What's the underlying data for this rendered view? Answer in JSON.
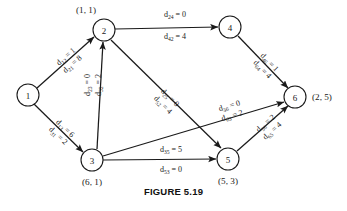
{
  "figure": {
    "caption": "FIGURE 5.19",
    "type": "directed-graph-diagram"
  },
  "nodes": [
    {
      "id": "1",
      "label_pair": "",
      "cx": 28,
      "cy": 95,
      "r": 11
    },
    {
      "id": "2",
      "label_pair": "(1, 1)",
      "cx": 104,
      "cy": 30,
      "r": 11
    },
    {
      "id": "3",
      "label_pair": "(6, 1)",
      "cx": 92,
      "cy": 160,
      "r": 11
    },
    {
      "id": "4",
      "label_pair": "",
      "cx": 230,
      "cy": 27,
      "r": 11
    },
    {
      "id": "5",
      "label_pair": "(5, 3)",
      "cx": 228,
      "cy": 159,
      "r": 11
    },
    {
      "id": "6",
      "label_pair": "(2, 5)",
      "cx": 295,
      "cy": 97,
      "r": 11
    }
  ],
  "edges": [
    {
      "name": "edge-1-2",
      "from": "1",
      "to": "2",
      "forward_label": "d12 = 1",
      "reverse_label": "d21 = 8",
      "forward": {
        "sub": "12",
        "value": "1"
      },
      "reverse": {
        "sub": "21",
        "value": "8"
      }
    },
    {
      "name": "edge-1-3",
      "from": "1",
      "to": "3",
      "forward_label": "d13 = 6",
      "reverse_label": "d31 = 2",
      "forward": {
        "sub": "13",
        "value": "6"
      },
      "reverse": {
        "sub": "31",
        "value": "2"
      }
    },
    {
      "name": "edge-2-3",
      "from": "3",
      "to": "2",
      "forward_label": "d23 = 0",
      "reverse_label": "d32 = 2",
      "forward": {
        "sub": "23",
        "value": "0"
      },
      "reverse": {
        "sub": "32",
        "value": "2"
      }
    },
    {
      "name": "edge-2-4",
      "from": "2",
      "to": "4",
      "forward_label": "d24 = 0",
      "reverse_label": "d42 = 4",
      "forward": {
        "sub": "24",
        "value": "0"
      },
      "reverse": {
        "sub": "42",
        "value": "4"
      }
    },
    {
      "name": "edge-2-5",
      "from": "2",
      "to": "5",
      "forward_label": "d25 = 0",
      "reverse_label": "d52 = 4",
      "forward": {
        "sub": "25",
        "value": "0"
      },
      "reverse": {
        "sub": "52",
        "value": "4"
      }
    },
    {
      "name": "edge-4-6",
      "from": "4",
      "to": "6",
      "forward_label": "d46 = 1",
      "reverse_label": "d64 = 4",
      "forward": {
        "sub": "46",
        "value": "1"
      },
      "reverse": {
        "sub": "64",
        "value": "4"
      }
    },
    {
      "name": "edge-3-6",
      "from": "3",
      "to": "6",
      "forward_label": "d36 = 0",
      "reverse_label": "d63 = 2",
      "forward": {
        "sub": "36",
        "value": "0"
      },
      "reverse": {
        "sub": "63",
        "value": "2"
      }
    },
    {
      "name": "edge-3-5",
      "from": "3",
      "to": "5",
      "forward_label": "d35 = 5",
      "reverse_label": "d53 = 0",
      "forward": {
        "sub": "35",
        "value": "5"
      },
      "reverse": {
        "sub": "53",
        "value": "0"
      }
    },
    {
      "name": "edge-5-6",
      "from": "5",
      "to": "6",
      "forward_label": "d56 = 2",
      "reverse_label": "d65 = 4",
      "forward": {
        "sub": "56",
        "value": "2"
      },
      "reverse": {
        "sub": "65",
        "value": "4"
      }
    }
  ],
  "colors": {
    "ink": "#1a1a1a",
    "background": "#ffffff"
  }
}
